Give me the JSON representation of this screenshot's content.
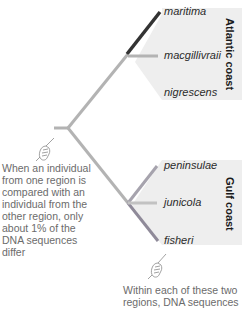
{
  "colors": {
    "atlantic_shade": "#eeeeee",
    "gulf_shade": "#eeeeee",
    "branch_gray": "#b3b3b3",
    "branch_dark": "#333333",
    "branch_purple_gray": "#8f8a99",
    "note_text": "#6b6b6b"
  },
  "regions": [
    {
      "label": "Atlantic coast",
      "taxa": [
        "maritima",
        "macgillivraii",
        "nigrescens"
      ]
    },
    {
      "label": "Gulf coast",
      "taxa": [
        "peninsulae",
        "junicola",
        "fisheri"
      ]
    }
  ],
  "taxa": {
    "maritima": "maritima",
    "macgillivraii": "macgillivraii",
    "nigrescens": "nigrescens",
    "peninsulae": "peninsulae",
    "junicola": "junicola",
    "fisheri": "fisheri"
  },
  "notes": {
    "between_regions": "When an individual from one region is compared with an individual from the other region, only about 1% of the DNA sequences differ",
    "within_regions": "Within each of these two regions, DNA sequences"
  },
  "icons": {
    "hand_left": "pointing-hand-icon",
    "hand_bottom": "pointing-hand-icon"
  }
}
